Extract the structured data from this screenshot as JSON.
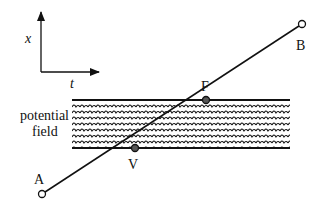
{
  "axes": {
    "x_label": "x",
    "t_label": "t"
  },
  "field": {
    "label_line1": "potential",
    "label_line2": "field"
  },
  "points": {
    "A": {
      "label": "A",
      "x": 42,
      "y": 194
    },
    "B": {
      "label": "B",
      "x": 302,
      "y": 24
    },
    "F": {
      "label": "F",
      "x": 206,
      "y": 100
    },
    "V": {
      "label": "V",
      "x": 135,
      "y": 148
    }
  },
  "colors": {
    "ink": "#111111",
    "background": "#ffffff"
  }
}
